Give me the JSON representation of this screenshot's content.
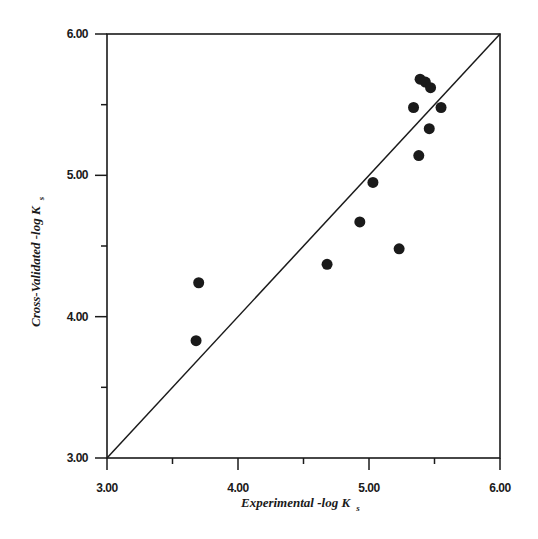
{
  "chart_data": {
    "type": "scatter",
    "title": "",
    "xlabel": "Experimental -log K",
    "xlabel_subscript": "s",
    "ylabel": "Cross-Validated -log K",
    "ylabel_subscript": "s",
    "xlim": [
      3.0,
      6.0
    ],
    "ylim": [
      3.0,
      6.0
    ],
    "x_ticks": [
      3.0,
      4.0,
      5.0,
      6.0
    ],
    "x_tick_labels": [
      "3.00",
      "4.00",
      "5.00",
      "6.00"
    ],
    "y_ticks": [
      3.0,
      4.0,
      5.0,
      6.0
    ],
    "y_tick_labels": [
      "3.00",
      "4.00",
      "5.00",
      "6.00"
    ],
    "minor_ticks": [
      3.5,
      4.5,
      5.5
    ],
    "grid": false,
    "legend": null,
    "reference_line": {
      "label": "y = x",
      "from": [
        3.0,
        3.0
      ],
      "to": [
        6.0,
        6.0
      ]
    },
    "series": [
      {
        "name": "compounds",
        "marker": "filled-circle",
        "color": "#1a1a1a",
        "points": [
          {
            "x": 3.7,
            "y": 4.24
          },
          {
            "x": 3.68,
            "y": 3.83
          },
          {
            "x": 4.68,
            "y": 4.37
          },
          {
            "x": 4.93,
            "y": 4.67
          },
          {
            "x": 5.03,
            "y": 4.95
          },
          {
            "x": 5.23,
            "y": 4.48
          },
          {
            "x": 5.38,
            "y": 5.14
          },
          {
            "x": 5.46,
            "y": 5.33
          },
          {
            "x": 5.34,
            "y": 5.48
          },
          {
            "x": 5.55,
            "y": 5.48
          },
          {
            "x": 5.39,
            "y": 5.68
          },
          {
            "x": 5.43,
            "y": 5.66
          },
          {
            "x": 5.47,
            "y": 5.62
          }
        ]
      }
    ]
  },
  "colors": {
    "ink": "#1a1a1a",
    "background": "#ffffff"
  }
}
